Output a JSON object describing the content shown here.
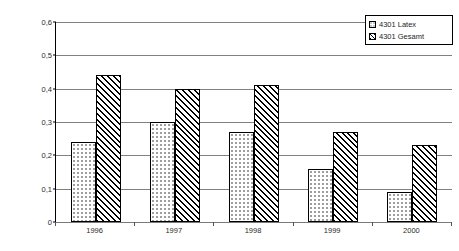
{
  "chart_data": {
    "type": "bar",
    "title": "",
    "subtitle": "",
    "xlabel": "",
    "ylabel": "Inzidenz der BK-Verdachtsfälle je 1 000 Versicherte",
    "categories": [
      "1996",
      "1997",
      "1998",
      "1999",
      "2000"
    ],
    "series": [
      {
        "name": "4301 Latex",
        "values": [
          0.24,
          0.3,
          0.27,
          0.16,
          0.09
        ]
      },
      {
        "name": "4301 Gesamt",
        "values": [
          0.44,
          0.4,
          0.41,
          0.27,
          0.23
        ]
      }
    ],
    "ylim": [
      0,
      0.6
    ],
    "ytick_labels": [
      "0,6",
      "0,5",
      "0,4",
      "0,3",
      "0,2",
      "0,1",
      "0"
    ],
    "ytick_values": [
      0.6,
      0.5,
      0.4,
      0.3,
      0.2,
      0.1,
      0
    ],
    "grid": true,
    "legend_position": "top-right",
    "colors": {
      "latex_fill": "#ffffff",
      "latex_pattern": "#9a9a9a",
      "gesamt_fill": "#ffffff",
      "gesamt_pattern": "#000000",
      "gridline": "#808080",
      "axis": "#000000",
      "text": "#2b2b2b"
    }
  },
  "legend": {
    "entries": [
      {
        "label": "4301 Latex",
        "pattern": "dotted-swatch"
      },
      {
        "label": "4301 Gesamt",
        "pattern": "hatched-swatch"
      }
    ]
  }
}
